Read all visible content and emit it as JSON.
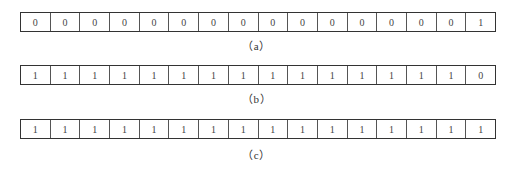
{
  "figures": [
    {
      "id": "a",
      "caption": "（a）",
      "bits": [
        "0",
        "0",
        "0",
        "0",
        "0",
        "0",
        "0",
        "0",
        "0",
        "0",
        "0",
        "0",
        "0",
        "0",
        "0",
        "1"
      ]
    },
    {
      "id": "b",
      "caption": "（b）",
      "bits": [
        "1",
        "1",
        "1",
        "1",
        "1",
        "1",
        "1",
        "1",
        "1",
        "1",
        "1",
        "1",
        "1",
        "1",
        "1",
        "0"
      ]
    },
    {
      "id": "c",
      "caption": "（c）",
      "bits": [
        "1",
        "1",
        "1",
        "1",
        "1",
        "1",
        "1",
        "1",
        "1",
        "1",
        "1",
        "1",
        "1",
        "1",
        "1",
        "1"
      ]
    }
  ]
}
